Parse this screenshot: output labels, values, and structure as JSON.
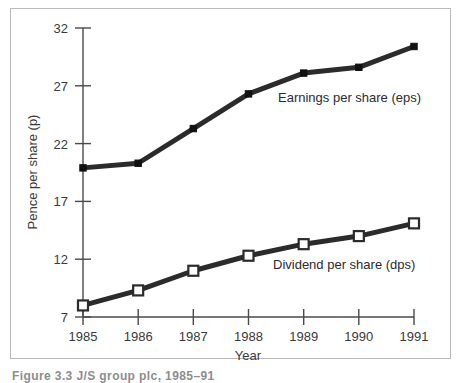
{
  "figure": {
    "caption": "Figure 3.3   J/S group plc, 1985–91"
  },
  "chart_data": {
    "type": "line",
    "title": "",
    "xlabel": "Year",
    "ylabel": "Pence per share (p)",
    "categories": [
      "1985",
      "1986",
      "1987",
      "1988",
      "1989",
      "1990",
      "1991"
    ],
    "x": [
      1985,
      1986,
      1987,
      1988,
      1989,
      1990,
      1991
    ],
    "xlim": [
      1985,
      1991
    ],
    "ylim": [
      7,
      32
    ],
    "yticks": [
      7,
      12,
      17,
      22,
      27,
      32
    ],
    "ytick_labels": [
      "7",
      "12",
      "17",
      "22",
      "27",
      "32"
    ],
    "grid": false,
    "legend_position": "inline-annotation",
    "series": [
      {
        "name": "Earnings per share (eps)",
        "marker": "filled-square",
        "color": "#2b2b2b",
        "values": [
          19.9,
          20.3,
          23.3,
          26.3,
          28.1,
          28.6,
          30.4
        ]
      },
      {
        "name": "Dividend per share (dps)",
        "marker": "open-square",
        "color": "#2b2b2b",
        "values": [
          8.0,
          9.3,
          11.0,
          12.3,
          13.3,
          14.0,
          15.1
        ]
      }
    ],
    "annotations": [
      {
        "text": "Earnings per share (eps)",
        "x": 1988.55,
        "y": 25.6
      },
      {
        "text": "Dividend per share (dps)",
        "x": 1988.45,
        "y": 11.2
      }
    ]
  }
}
